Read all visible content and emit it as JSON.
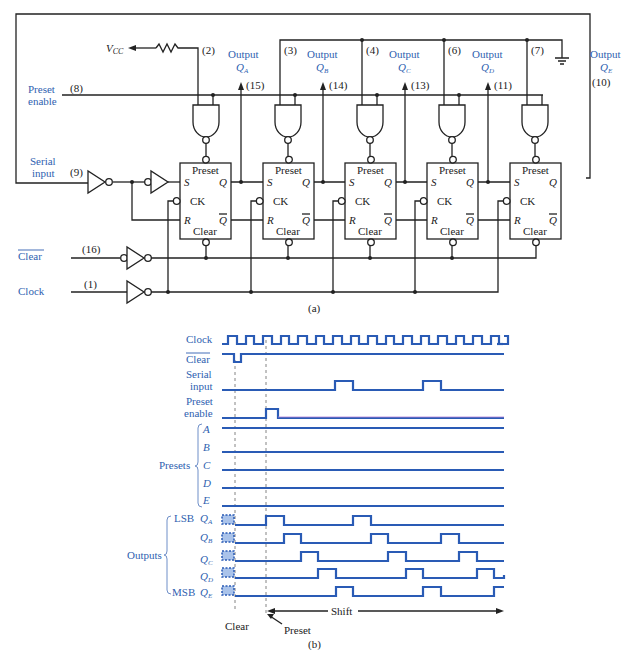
{
  "figure": {
    "part_a_label": "(a)",
    "part_b_label": "(b)"
  },
  "circuit": {
    "vcc_label": "V",
    "vcc_sub": "CC",
    "inputs": {
      "preset_enable": {
        "line1": "Preset",
        "line2": "enable",
        "pin": "(8)"
      },
      "serial_input": {
        "line1": "Serial",
        "line2": "input",
        "pin": "(9)"
      },
      "clear": {
        "label": "Clear",
        "pin": "(16)",
        "overbar": true
      },
      "clock": {
        "label": "Clock",
        "pin": "(1)"
      }
    },
    "preset_pins": [
      "(2)",
      "(3)",
      "(4)",
      "(6)",
      "(7)"
    ],
    "outputs": [
      {
        "label": "Output",
        "q": "Q",
        "sub": "A",
        "pin": "(15)"
      },
      {
        "label": "Output",
        "q": "Q",
        "sub": "B",
        "pin": "(14)"
      },
      {
        "label": "Output",
        "q": "Q",
        "sub": "C",
        "pin": "(13)"
      },
      {
        "label": "Output",
        "q": "Q",
        "sub": "D",
        "pin": "(11)"
      },
      {
        "label": "Output",
        "q": "Q",
        "sub": "E",
        "pin": "(10)"
      }
    ],
    "flipflop": {
      "preset": "Preset",
      "clear": "Clear",
      "s": "S",
      "r": "R",
      "ck": "CK",
      "q": "Q",
      "qbar": "Q"
    }
  },
  "timing": {
    "signals": {
      "clock": "Clock",
      "clear": "Clear",
      "serial_1": "Serial",
      "serial_2": "input",
      "preset_1": "Preset",
      "preset_2": "enable"
    },
    "presets_group": "Presets",
    "presets": [
      "A",
      "B",
      "C",
      "D",
      "E"
    ],
    "outputs_group": "Outputs",
    "lsb": "LSB",
    "msb": "MSB",
    "outputs": [
      {
        "q": "Q",
        "sub": "A"
      },
      {
        "q": "Q",
        "sub": "B"
      },
      {
        "q": "Q",
        "sub": "C"
      },
      {
        "q": "Q",
        "sub": "D"
      },
      {
        "q": "Q",
        "sub": "E"
      }
    ],
    "markers": {
      "clear": "Clear",
      "preset": "Preset",
      "shift": "Shift"
    },
    "colors": {
      "waveform": "#2a5bb5",
      "label": "#2f5fb0"
    }
  }
}
